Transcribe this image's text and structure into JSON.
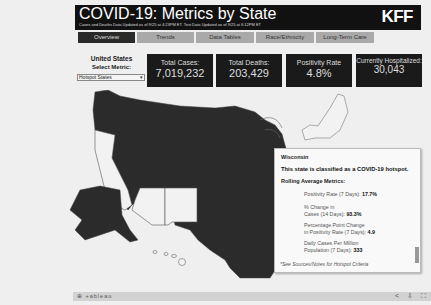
{
  "header": {
    "title": "COVID-19: Metrics by State",
    "subtitle": "Cases and Deaths Data Updated as of 9/25 at 4:23PM ET. Test Data Updated as of 9/25 at 6:12PM ET",
    "logo": "KFF"
  },
  "tabs": [
    {
      "label": "Overview",
      "active": true
    },
    {
      "label": "Trends",
      "active": false
    },
    {
      "label": "Data Tables",
      "active": false
    },
    {
      "label": "Race/Ethnicity",
      "active": false
    },
    {
      "label": "Long-Term Care",
      "active": false
    }
  ],
  "filter": {
    "region_label": "United States",
    "metric_label": "Select Metric:",
    "metric_value": "Hotspot States"
  },
  "stats": {
    "cases": {
      "label": "Total Cases:",
      "value": "7,019,232"
    },
    "deaths": {
      "label": "Total Deaths:",
      "value": "203,429"
    },
    "positivity": {
      "label": "Positivity Rate",
      "value": "4.8%"
    },
    "hospitalized": {
      "label": "Currently Hospitalized:",
      "value": "30,043"
    }
  },
  "colors": {
    "hotspot": "#2b2b2b",
    "non_hotspot": "#f2f2f2",
    "header_bg": "#111111"
  },
  "tooltip": {
    "state": "Wisconsin",
    "classification": "This state is classified as a COVID-19 hotspot.",
    "rolling_label": "Rolling Average Metrics:",
    "metrics": [
      {
        "label": "Positivity Rate (7 Days):",
        "value": "17.7%"
      },
      {
        "label1": "% Change in",
        "label2": "Cases (14 Days):",
        "value": "93.3%"
      },
      {
        "label1": "Percentage Point Change",
        "label2": "in Positivity Rate (7 Days):",
        "value": "4.9"
      },
      {
        "label1": "Daily Cases Per Million",
        "label2": "Population (7 Days):",
        "value": "333"
      }
    ],
    "footnote": "*See Sources/Notes for Hotspot Criteria"
  },
  "footer": {
    "brand": "⊕ +ableau",
    "icons": [
      "share-icon",
      "download-icon",
      "fullscreen-icon"
    ]
  }
}
